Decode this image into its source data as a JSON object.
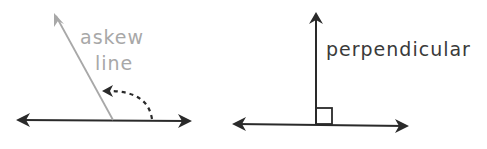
{
  "figure": {
    "left_panel": {
      "label_line1": "askew",
      "label_line2": "line",
      "label_color": "#a8a8a8",
      "askew_line_color": "#a8a8a8",
      "base_line_color": "#2a2a2a",
      "arc_arrow_style": "dashed"
    },
    "right_panel": {
      "label": "perpendicular",
      "label_color": "#3a3a3a",
      "line_color": "#2a2a2a",
      "right_angle_marker": true
    }
  }
}
